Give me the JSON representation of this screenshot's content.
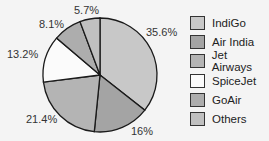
{
  "chart_data": {
    "type": "pie",
    "title": "",
    "categories": [
      "IndiGo",
      "Air India",
      "Jet Airways",
      "SpiceJet",
      "GoAir",
      "Others"
    ],
    "values": [
      35.6,
      16,
      21.4,
      13.2,
      8.1,
      5.7
    ],
    "labels": [
      "35.6%",
      "16%",
      "21.4%",
      "13.2%",
      "8.1%",
      "5.7%"
    ],
    "colors": [
      "#c8c8c8",
      "#a4a4a4",
      "#b4b4b4",
      "#fbfbfb",
      "#adadad",
      "#c0c0c0"
    ],
    "start_angle": "12 o'clock",
    "direction": "clockwise",
    "legend_position": "right"
  },
  "legend": {
    "items": [
      {
        "label": "IndiGo"
      },
      {
        "label": "Air India"
      },
      {
        "label": "Jet Airways"
      },
      {
        "label": "SpiceJet"
      },
      {
        "label": "GoAir"
      },
      {
        "label": "Others"
      }
    ]
  }
}
